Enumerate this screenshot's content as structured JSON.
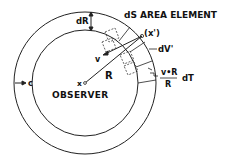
{
  "diagram": {
    "labels": {
      "area_element": "dS AREA ELEMENT",
      "dR": "dR",
      "point": "(x')",
      "dV": "dV'",
      "v": "v",
      "R": "R",
      "c": "c",
      "x": "x",
      "observer": "OBSERVER",
      "fraction_num": "v•R",
      "fraction_den": "R",
      "dT": "dT"
    },
    "geometry": {
      "center": [
        85,
        83
      ],
      "inner_radius": 53,
      "outer_radius": 71
    },
    "colors": {
      "stroke": "#222222",
      "background": "#ffffff"
    }
  }
}
